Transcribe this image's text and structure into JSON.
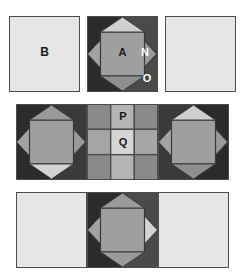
{
  "figure": {
    "title": "",
    "background": "#ffffff",
    "width": 245,
    "height": 279
  },
  "palette": {
    "plain_light": "#e6e6e6",
    "corner_dark": "#2b2b2b",
    "corner_dark_right": "#4a4a4a",
    "diamond_mid": "#9a9a9a",
    "diamond_left": "#a3a3a3",
    "diamond_top_light": "#cfcfcf",
    "diamond_bottom_light": "#d4d4d4",
    "inner_square": "#9f9f9f",
    "grid_mid": "#8a8a8a",
    "grid_light": "#b4b4b4",
    "grid_lightest": "#d6d6d6",
    "outline": "#4d4d4d",
    "label_dark": "#1a1a1a",
    "label_light": "#ffffff"
  },
  "labels": {
    "A": "A",
    "B": "B",
    "N": "N",
    "O": "O",
    "P": "P",
    "Q": "Q"
  },
  "rows": [
    {
      "name": "top-row",
      "tiles": [
        {
          "name": "tile-plain-left",
          "kind": "plain"
        },
        {
          "name": "tile-diamond-center",
          "kind": "diamond"
        },
        {
          "name": "tile-plain-right",
          "kind": "plain"
        }
      ]
    },
    {
      "name": "middle-row",
      "tiles": [
        {
          "name": "tile-diamond-left",
          "kind": "diamond"
        },
        {
          "name": "tile-grid-center",
          "kind": "grid3x3"
        },
        {
          "name": "tile-diamond-right",
          "kind": "diamond"
        }
      ]
    },
    {
      "name": "bottom-row",
      "tiles": [
        {
          "name": "tile-plain-left",
          "kind": "plain"
        },
        {
          "name": "tile-diamond-center",
          "kind": "diamond"
        },
        {
          "name": "tile-plain-right",
          "kind": "plain"
        }
      ]
    }
  ],
  "grid3x3": {
    "cells": [
      {
        "name": "cell-r1c1",
        "shade": "grid_mid",
        "label": ""
      },
      {
        "name": "cell-r1c2",
        "shade": "grid_light",
        "label": "P"
      },
      {
        "name": "cell-r1c3",
        "shade": "grid_mid",
        "label": ""
      },
      {
        "name": "cell-r2c1",
        "shade": "grid_light",
        "label": ""
      },
      {
        "name": "cell-r2c2",
        "shade": "grid_lightest",
        "label": "Q"
      },
      {
        "name": "cell-r2c3",
        "shade": "grid_light",
        "label": ""
      },
      {
        "name": "cell-r3c1",
        "shade": "grid_mid",
        "label": ""
      },
      {
        "name": "cell-r3c2",
        "shade": "grid_light",
        "label": ""
      },
      {
        "name": "cell-r3c3",
        "shade": "grid_mid",
        "label": ""
      }
    ]
  }
}
